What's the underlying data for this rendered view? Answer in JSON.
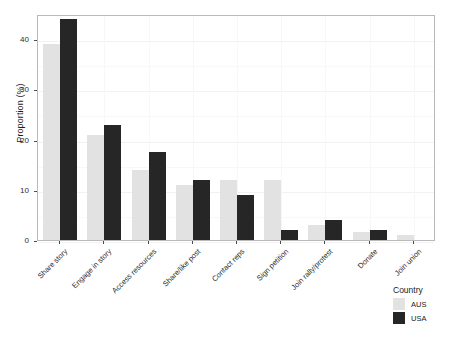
{
  "chart_data": {
    "type": "bar",
    "title": "",
    "xlabel": "",
    "ylabel": "Proportion (%)",
    "ylim": [
      0,
      45
    ],
    "yticks": [
      0,
      10,
      20,
      30,
      40
    ],
    "ytick_labels": [
      "0",
      "10",
      "20",
      "30",
      "40"
    ],
    "grid": true,
    "legend_position": "bottom-right",
    "legend_title": "Country",
    "categories": [
      "Share story",
      "Engage in story",
      "Access resources",
      "Share/like post",
      "Contact reps",
      "Sign petition",
      "Join rally/protest",
      "Donate",
      "Join union"
    ],
    "series": [
      {
        "name": "AUS",
        "color": "#e2e2e2",
        "values": [
          39,
          21,
          14,
          11,
          12,
          12,
          3,
          1.5,
          1
        ]
      },
      {
        "name": "USA",
        "color": "#262626",
        "values": [
          44,
          23,
          17.5,
          12,
          9,
          2,
          4,
          2,
          0
        ]
      }
    ]
  },
  "legend": {
    "title": "Country",
    "items": [
      {
        "label": "AUS",
        "color": "#e2e2e2"
      },
      {
        "label": "USA",
        "color": "#262626"
      }
    ]
  },
  "axes": {
    "y_title": "Proportion (%)"
  }
}
